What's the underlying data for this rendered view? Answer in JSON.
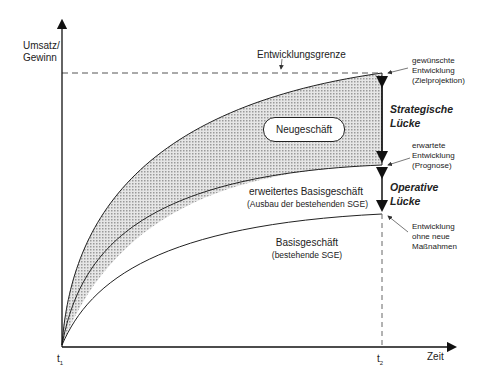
{
  "diagram": {
    "y_axis_label_line1": "Umsatz/",
    "y_axis_label_line2": "Gewinn",
    "x_axis_label": "Zeit",
    "t1_label": "t",
    "t1_sub": "1",
    "t2_label": "t",
    "t2_sub": "2",
    "limit_label": "Entwicklungsgrenze",
    "new_business_label": "Neugeschäft",
    "extended_base_label": "erweitertes Basisgeschäft",
    "extended_base_sub": "(Ausbau der bestehenden SGE)",
    "base_label": "Basisgeschäft",
    "base_sub": "(bestehende SGE)",
    "strategic_gap_line1": "Strategische",
    "strategic_gap_line2": "Lücke",
    "operative_gap_line1": "Operative",
    "operative_gap_line2": "Lücke",
    "desired_line1": "gewünschte",
    "desired_line2": "Entwicklung",
    "desired_line3": "(Zielprojektion)",
    "expected_line1": "erwartete",
    "expected_line2": "Entwicklung",
    "expected_line3": "(Prognose)",
    "nochange_line1": "Entwicklung",
    "nochange_line2": "ohne neue",
    "nochange_line3": "Maßnahmen",
    "colors": {
      "line": "#222222",
      "dashed": "#555555",
      "hatch": "#bdbdbd"
    }
  }
}
